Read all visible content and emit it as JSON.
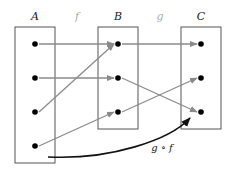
{
  "sets": [
    {
      "label": "A",
      "x": 15,
      "y": 27,
      "w": 40,
      "h": 136,
      "points": [
        44,
        78,
        112,
        146
      ],
      "px": 35
    },
    {
      "label": "B",
      "x": 98,
      "y": 27,
      "w": 40,
      "h": 102,
      "points": [
        44,
        78,
        112
      ],
      "px": 118
    },
    {
      "label": "C",
      "x": 181,
      "y": 27,
      "w": 40,
      "h": 102,
      "points": [
        44,
        78,
        112
      ],
      "px": 201
    }
  ],
  "functions": {
    "f": {
      "label": "f",
      "maps": [
        [
          0,
          0
        ],
        [
          1,
          1
        ],
        [
          2,
          0
        ],
        [
          3,
          2
        ]
      ]
    },
    "g": {
      "label": "g",
      "maps": [
        [
          0,
          0
        ],
        [
          1,
          2
        ],
        [
          2,
          1
        ]
      ]
    }
  },
  "composite": {
    "label": "g ∘ f"
  },
  "colors": {
    "box": "#555555",
    "arrow": "#8a8a8a",
    "point": "#000000",
    "curve": "#111111",
    "faint_label": "#aaaaaa"
  }
}
